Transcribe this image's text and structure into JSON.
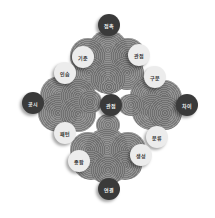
{
  "diagram": {
    "title": "",
    "colors": {
      "petal": "#7d7d7d",
      "dark_node": "#3a3a3a",
      "light_node": "#ececec",
      "background": "#ffffff"
    },
    "center": {
      "label": "관점",
      "style": "dark"
    },
    "clusters": [
      {
        "position": "top",
        "outer": {
          "label": "접촉",
          "style": "dark"
        },
        "sides": [
          {
            "label": "기준",
            "style": "light"
          },
          {
            "label": "관점",
            "style": "light"
          }
        ]
      },
      {
        "position": "left",
        "outer": {
          "label": "공시",
          "style": "dark"
        },
        "sides": [
          {
            "label": "인습",
            "style": "light"
          },
          {
            "label": "패턴",
            "style": "light"
          }
        ]
      },
      {
        "position": "right",
        "outer": {
          "label": "차이",
          "style": "dark"
        },
        "sides": [
          {
            "label": "구분",
            "style": "light"
          },
          {
            "label": "분류",
            "style": "light"
          }
        ]
      },
      {
        "position": "bottom",
        "outer": {
          "label": "연결",
          "style": "dark"
        },
        "sides": [
          {
            "label": "종합",
            "style": "light"
          },
          {
            "label": "생성",
            "style": "light"
          }
        ]
      }
    ]
  }
}
